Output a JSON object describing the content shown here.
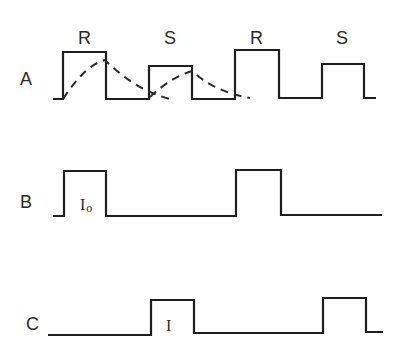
{
  "rows": [
    {
      "label": "A",
      "pulse_labels": [
        "R",
        "S",
        "R",
        "S"
      ],
      "waveform": "53,99 63,99 63,52 106,52 106,99 149,99 149,66 192,66 192,99 235,99 235,50 279,50 279,98 322,98 322,64 364,64 364,98 376,98",
      "dashed_curves": [
        "M63,99 Q85,65 105,60 Q135,90 170,99",
        "M150,97 Q170,78 192,71 Q215,92 250,98"
      ]
    },
    {
      "label": "B",
      "pulse_label": "I",
      "pulse_subscript": "o",
      "waveform": "53,216 64,216 64,171 106,171 106,216 236,216 236,170 281,170 281,215 382,215"
    },
    {
      "label": "C",
      "pulse_label": "I",
      "waveform": "48,335 151,335 151,300 194,300 194,333 323,333 323,298 366,298 366,332 383,332"
    }
  ]
}
